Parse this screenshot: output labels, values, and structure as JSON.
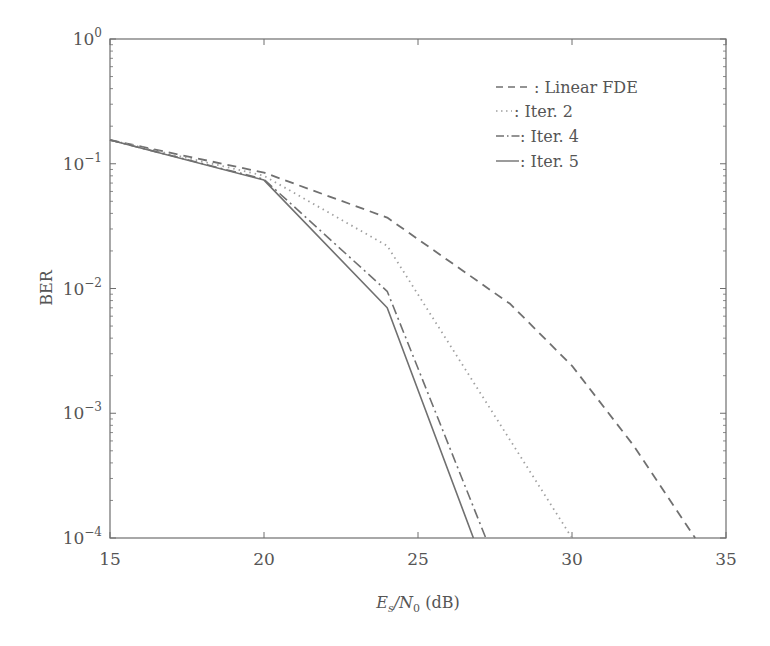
{
  "chart_data": {
    "type": "line",
    "title": "",
    "xlabel": "Es/N0 (dB)",
    "xlabel_parts": {
      "main": "E",
      "sub1": "s",
      "slash": "/N",
      "sub2": "0",
      "unit": " (dB)"
    },
    "ylabel": "BER",
    "xlim": [
      15,
      35
    ],
    "ylim": [
      0.0001,
      1
    ],
    "yscale": "log",
    "grid": false,
    "legend_position": "upper right (inside)",
    "x_ticks": [
      15,
      20,
      25,
      30,
      35
    ],
    "y_ticks": [
      {
        "base": "10",
        "exp": "0",
        "value": 1
      },
      {
        "base": "10",
        "exp": "−1",
        "value": 0.1
      },
      {
        "base": "10",
        "exp": "−2",
        "value": 0.01
      },
      {
        "base": "10",
        "exp": "−3",
        "value": 0.001
      },
      {
        "base": "10",
        "exp": "−4",
        "value": 0.0001
      }
    ],
    "series": [
      {
        "name": "Linear FDE",
        "legend_label": "- - - : Linear FDE",
        "style": "dashed",
        "x": [
          15,
          20,
          24,
          28,
          30,
          32,
          34
        ],
        "values": [
          0.155,
          0.085,
          0.037,
          0.0075,
          0.0024,
          0.00055,
          0.0001
        ]
      },
      {
        "name": "Iter. 2",
        "legend_label": "· · · : Iter. 2",
        "style": "dotted",
        "x": [
          15,
          20,
          24,
          30
        ],
        "values": [
          0.155,
          0.08,
          0.022,
          0.0001
        ]
      },
      {
        "name": "Iter. 4",
        "legend_label": "- · - : Iter. 4",
        "style": "dashdot",
        "x": [
          15,
          20,
          24,
          27.2
        ],
        "values": [
          0.155,
          0.075,
          0.0095,
          0.0001
        ]
      },
      {
        "name": "Iter. 5",
        "legend_label": "—— : Iter. 5",
        "style": "solid",
        "x": [
          15,
          20,
          24,
          26.8
        ],
        "values": [
          0.155,
          0.074,
          0.007,
          0.0001
        ]
      }
    ]
  },
  "legend": {
    "items": [
      {
        "label": ": Linear FDE"
      },
      {
        "label": ": Iter. 2"
      },
      {
        "label": ": Iter. 4"
      },
      {
        "label": ": Iter. 5"
      }
    ]
  },
  "colors": {
    "axis": "#6e6e6e",
    "line": "#707070",
    "dotted": "#a0a0a0"
  }
}
